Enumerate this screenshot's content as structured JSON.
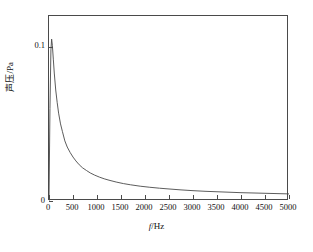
{
  "chart_data": {
    "type": "line",
    "title": "",
    "subtitle": "",
    "xlabel": "f/Hz",
    "xlabel_italic_part": "f",
    "xlabel_rest": "/Hz",
    "ylabel": "声压/Pa",
    "xlim": [
      0,
      5000
    ],
    "ylim": [
      0,
      0.12
    ],
    "xticks": [
      0,
      500,
      1000,
      1500,
      2000,
      2500,
      3000,
      3500,
      4000,
      4500,
      5000
    ],
    "xtick_labels": [
      "0",
      "500",
      "1000",
      "1500",
      "2000",
      "2500",
      "3000",
      "3500",
      "4000",
      "4500",
      "5000"
    ],
    "yticks": [
      0,
      0.1
    ],
    "ytick_labels": [
      "0",
      "0.1"
    ],
    "grid": false,
    "legend": null,
    "line_color": "#4a4a4a",
    "line_width": 0.9,
    "series": [
      {
        "name": "sound pressure",
        "x": [
          0,
          20,
          40,
          55,
          70,
          90,
          110,
          140,
          170,
          200,
          240,
          280,
          330,
          380,
          440,
          500,
          560,
          630,
          700,
          780,
          860,
          950,
          1050,
          1150,
          1250,
          1400,
          1550,
          1700,
          1900,
          2100,
          2300,
          2500,
          2750,
          3000,
          3250,
          3500,
          3750,
          4000,
          4250,
          4500,
          4750,
          5000
        ],
        "values": [
          0.0,
          0.06,
          0.098,
          0.105,
          0.101,
          0.092,
          0.083,
          0.072,
          0.064,
          0.057,
          0.05,
          0.045,
          0.039,
          0.035,
          0.0315,
          0.0285,
          0.026,
          0.0235,
          0.0215,
          0.0198,
          0.0182,
          0.0168,
          0.0155,
          0.0144,
          0.0135,
          0.0123,
          0.0113,
          0.0105,
          0.0096,
          0.0089,
          0.0083,
          0.0078,
          0.0072,
          0.0067,
          0.0063,
          0.006,
          0.0057,
          0.0054,
          0.0052,
          0.005,
          0.0048,
          0.0046
        ]
      }
    ],
    "peak": {
      "x": 55,
      "y": 0.105
    }
  }
}
